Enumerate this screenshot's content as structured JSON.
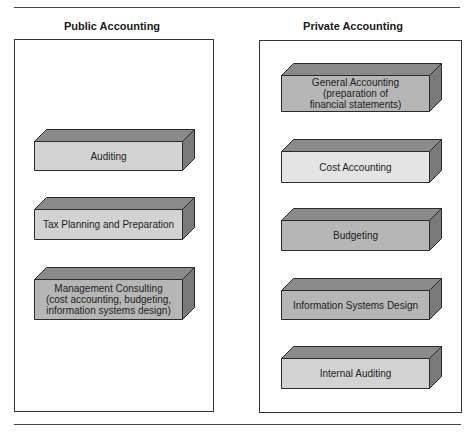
{
  "columns": [
    {
      "title": "Public Accounting",
      "boxes": [
        {
          "label": "Auditing",
          "shade": "light"
        },
        {
          "label": "Tax Planning and Preparation",
          "shade": "light"
        },
        {
          "label": "Management Consulting\n(cost accounting, budgeting,\ninformation systems design)",
          "shade": "medium"
        }
      ]
    },
    {
      "title": "Private Accounting",
      "boxes": [
        {
          "label": "General Accounting\n(preparation of\nfinancial statements)",
          "shade": "medium"
        },
        {
          "label": "Cost Accounting",
          "shade": "pale"
        },
        {
          "label": "Budgeting",
          "shade": "medium"
        },
        {
          "label": "Information Systems Design",
          "shade": "medium"
        },
        {
          "label": "Internal Auditing",
          "shade": "light"
        }
      ]
    }
  ],
  "colors": {
    "pale_front": "#e4e4e4",
    "light_front": "#d2d2d2",
    "medium_front": "#b6b6b6",
    "top_face": "#8a8a8a",
    "side_face": "#7a7a7a",
    "outline": "#2a2a2a"
  }
}
